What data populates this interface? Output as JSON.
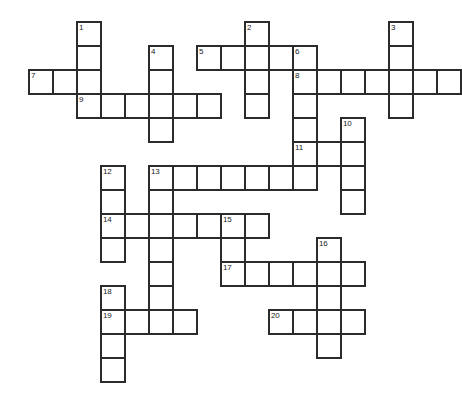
{
  "puzzle": {
    "title": "Crossword Grid",
    "type": "crossword-grid",
    "cell_size": 24,
    "border_color": "#2b2b2b",
    "cell_color": "#ffffff",
    "background": "#ffffff",
    "origin": {
      "x": 28,
      "y": 21
    },
    "numbers": [
      1,
      2,
      3,
      4,
      5,
      6,
      7,
      8,
      9,
      10,
      11,
      12,
      13,
      14,
      15,
      16,
      17,
      18,
      19,
      20
    ],
    "entries": [
      {
        "number": 1,
        "direction": "down",
        "col": 2,
        "row": 0,
        "length": 4
      },
      {
        "number": 2,
        "direction": "down",
        "col": 9,
        "row": 0,
        "length": 4
      },
      {
        "number": 3,
        "direction": "down",
        "col": 15,
        "row": 0,
        "length": 4
      },
      {
        "number": 4,
        "direction": "down",
        "col": 5,
        "row": 1,
        "length": 4
      },
      {
        "number": 5,
        "direction": "across",
        "col": 7,
        "row": 1,
        "length": 5
      },
      {
        "number": 6,
        "direction": "down",
        "col": 11,
        "row": 1,
        "length": 5
      },
      {
        "number": 7,
        "direction": "across",
        "col": 0,
        "row": 2,
        "length": 7
      },
      {
        "number": 8,
        "direction": "across",
        "col": 11,
        "row": 2,
        "length": 7
      },
      {
        "number": 9,
        "direction": "across",
        "col": 2,
        "row": 3,
        "length": 6
      },
      {
        "number": 10,
        "direction": "down",
        "col": 13,
        "row": 4,
        "length": 5
      },
      {
        "number": 11,
        "direction": "across",
        "col": 11,
        "row": 5,
        "length": 3
      },
      {
        "number": 12,
        "direction": "down",
        "col": 3,
        "row": 6,
        "length": 4
      },
      {
        "number": 13,
        "direction": "across",
        "col": 5,
        "row": 6,
        "length": 7
      },
      {
        "number": 13,
        "direction": "down",
        "col": 5,
        "row": 6,
        "length": 7
      },
      {
        "number": 14,
        "direction": "across",
        "col": 3,
        "row": 8,
        "length": 6
      },
      {
        "number": 15,
        "direction": "down",
        "col": 8,
        "row": 8,
        "length": 4
      },
      {
        "number": 16,
        "direction": "down",
        "col": 12,
        "row": 9,
        "length": 5
      },
      {
        "number": 17,
        "direction": "across",
        "col": 8,
        "row": 10,
        "length": 6
      },
      {
        "number": 18,
        "direction": "down",
        "col": 3,
        "row": 11,
        "length": 4
      },
      {
        "number": 19,
        "direction": "across",
        "col": 3,
        "row": 12,
        "length": 4
      },
      {
        "number": 20,
        "direction": "across",
        "col": 10,
        "row": 12,
        "length": 4
      }
    ],
    "cells": [
      {
        "col": 2,
        "row": 0,
        "num": "1"
      },
      {
        "col": 9,
        "row": 0,
        "num": "2"
      },
      {
        "col": 15,
        "row": 0,
        "num": "3"
      },
      {
        "col": 2,
        "row": 1,
        "num": ""
      },
      {
        "col": 5,
        "row": 1,
        "num": "4"
      },
      {
        "col": 7,
        "row": 1,
        "num": "5"
      },
      {
        "col": 8,
        "row": 1,
        "num": ""
      },
      {
        "col": 9,
        "row": 1,
        "num": ""
      },
      {
        "col": 10,
        "row": 1,
        "num": ""
      },
      {
        "col": 11,
        "row": 1,
        "num": "6"
      },
      {
        "col": 15,
        "row": 1,
        "num": ""
      },
      {
        "col": 0,
        "row": 2,
        "num": "7"
      },
      {
        "col": 1,
        "row": 2,
        "num": ""
      },
      {
        "col": 2,
        "row": 2,
        "num": ""
      },
      {
        "col": 5,
        "row": 2,
        "num": ""
      },
      {
        "col": 9,
        "row": 2,
        "num": ""
      },
      {
        "col": 11,
        "row": 2,
        "num": "8"
      },
      {
        "col": 12,
        "row": 2,
        "num": ""
      },
      {
        "col": 13,
        "row": 2,
        "num": ""
      },
      {
        "col": 14,
        "row": 2,
        "num": ""
      },
      {
        "col": 15,
        "row": 2,
        "num": ""
      },
      {
        "col": 16,
        "row": 2,
        "num": ""
      },
      {
        "col": 17,
        "row": 2,
        "num": ""
      },
      {
        "col": 2,
        "row": 3,
        "num": "9"
      },
      {
        "col": 3,
        "row": 3,
        "num": ""
      },
      {
        "col": 4,
        "row": 3,
        "num": ""
      },
      {
        "col": 5,
        "row": 3,
        "num": ""
      },
      {
        "col": 6,
        "row": 3,
        "num": ""
      },
      {
        "col": 7,
        "row": 3,
        "num": ""
      },
      {
        "col": 9,
        "row": 3,
        "num": ""
      },
      {
        "col": 11,
        "row": 3,
        "num": ""
      },
      {
        "col": 15,
        "row": 3,
        "num": ""
      },
      {
        "col": 5,
        "row": 4,
        "num": ""
      },
      {
        "col": 11,
        "row": 4,
        "num": ""
      },
      {
        "col": 13,
        "row": 4,
        "num": "10"
      },
      {
        "col": 11,
        "row": 5,
        "num": "11"
      },
      {
        "col": 12,
        "row": 5,
        "num": ""
      },
      {
        "col": 13,
        "row": 5,
        "num": ""
      },
      {
        "col": 3,
        "row": 6,
        "num": "12"
      },
      {
        "col": 5,
        "row": 6,
        "num": "13"
      },
      {
        "col": 6,
        "row": 6,
        "num": ""
      },
      {
        "col": 7,
        "row": 6,
        "num": ""
      },
      {
        "col": 8,
        "row": 6,
        "num": ""
      },
      {
        "col": 9,
        "row": 6,
        "num": ""
      },
      {
        "col": 10,
        "row": 6,
        "num": ""
      },
      {
        "col": 11,
        "row": 6,
        "num": ""
      },
      {
        "col": 13,
        "row": 6,
        "num": ""
      },
      {
        "col": 3,
        "row": 7,
        "num": ""
      },
      {
        "col": 5,
        "row": 7,
        "num": ""
      },
      {
        "col": 13,
        "row": 7,
        "num": ""
      },
      {
        "col": 3,
        "row": 8,
        "num": "14"
      },
      {
        "col": 4,
        "row": 8,
        "num": ""
      },
      {
        "col": 5,
        "row": 8,
        "num": ""
      },
      {
        "col": 6,
        "row": 8,
        "num": ""
      },
      {
        "col": 7,
        "row": 8,
        "num": ""
      },
      {
        "col": 8,
        "row": 8,
        "num": "15"
      },
      {
        "col": 9,
        "row": 8,
        "num": ""
      },
      {
        "col": 3,
        "row": 9,
        "num": ""
      },
      {
        "col": 5,
        "row": 9,
        "num": ""
      },
      {
        "col": 8,
        "row": 9,
        "num": ""
      },
      {
        "col": 12,
        "row": 9,
        "num": "16"
      },
      {
        "col": 5,
        "row": 10,
        "num": ""
      },
      {
        "col": 8,
        "row": 10,
        "num": "17"
      },
      {
        "col": 9,
        "row": 10,
        "num": ""
      },
      {
        "col": 10,
        "row": 10,
        "num": ""
      },
      {
        "col": 11,
        "row": 10,
        "num": ""
      },
      {
        "col": 12,
        "row": 10,
        "num": ""
      },
      {
        "col": 13,
        "row": 10,
        "num": ""
      },
      {
        "col": 3,
        "row": 11,
        "num": "18"
      },
      {
        "col": 5,
        "row": 11,
        "num": ""
      },
      {
        "col": 12,
        "row": 11,
        "num": ""
      },
      {
        "col": 3,
        "row": 12,
        "num": "19"
      },
      {
        "col": 4,
        "row": 12,
        "num": ""
      },
      {
        "col": 5,
        "row": 12,
        "num": ""
      },
      {
        "col": 6,
        "row": 12,
        "num": ""
      },
      {
        "col": 10,
        "row": 12,
        "num": "20"
      },
      {
        "col": 11,
        "row": 12,
        "num": ""
      },
      {
        "col": 12,
        "row": 12,
        "num": ""
      },
      {
        "col": 13,
        "row": 12,
        "num": ""
      },
      {
        "col": 3,
        "row": 13,
        "num": ""
      },
      {
        "col": 12,
        "row": 13,
        "num": ""
      },
      {
        "col": 3,
        "row": 14,
        "num": ""
      }
    ]
  }
}
